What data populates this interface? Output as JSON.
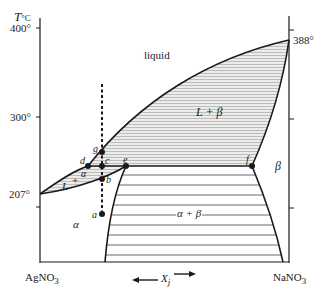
{
  "diagram": {
    "y_axis": {
      "label_T": "T",
      "label_unit": "°C",
      "ticks": [
        "400°",
        "300°",
        "207°"
      ],
      "right_label": "388°"
    },
    "x_axis": {
      "left_component": "AgNO",
      "left_sub": "3",
      "right_component": "NaNO",
      "right_sub": "3",
      "variable": "X",
      "variable_sub": "j"
    },
    "regions": {
      "liquid": "liquid",
      "l_plus_beta": "L + β",
      "beta": "β",
      "l_plus_alpha_L": "L",
      "l_plus_alpha_plus": "+",
      "l_plus_alpha_alpha": "α",
      "alpha": "α",
      "alpha_plus_beta": "α + β"
    },
    "points": {
      "a": "a",
      "b": "b",
      "c": "c",
      "d": "d",
      "e": "e",
      "f": "f",
      "g": "g"
    },
    "colors": {
      "line": "#1a1a1a",
      "hatch": "#9a9a9a",
      "shade": "#e6e6e6"
    }
  }
}
